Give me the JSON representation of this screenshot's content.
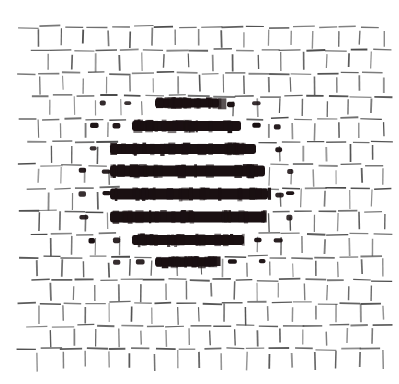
{
  "figure": {
    "title": "Halftone hatch texture with emphasized central lens",
    "type": "abstract-texture",
    "canvas": {
      "width": 399,
      "height": 384,
      "background": "#ffffff"
    },
    "pattern": {
      "name": "staggered-dash-lattice",
      "description": "Regular lattice of short horizontal and vertical dashes arranged in an alternating brick/weave layout",
      "cell_width": 23.0,
      "cell_height": 23.0,
      "origin_x": 27,
      "origin_y": 27,
      "columns": 16,
      "rows": 15,
      "row_stagger_offset": 11.5,
      "dash_horizontal_length": 20,
      "dash_vertical_length": 17,
      "stroke_thin_width": 1.4,
      "stroke_thin_color": "#4b4b4b",
      "stroke_bold_color": "#1a1012",
      "dot_bold_width": 7,
      "dot_bold_height": 4.5
    },
    "emphasis_region": {
      "shape": "lens",
      "center_x": 188,
      "center_y": 183,
      "semi_axis_x": 82,
      "semi_axis_y": 86,
      "fill_color": "#1a1012"
    },
    "bars": [
      {
        "index": 1,
        "x1": 155,
        "x2": 219,
        "y": 103,
        "thickness": 9
      },
      {
        "index": 2,
        "x1": 132,
        "x2": 241,
        "y": 126,
        "thickness": 10
      },
      {
        "index": 3,
        "x1": 110,
        "x2": 256,
        "y": 149,
        "thickness": 10
      },
      {
        "index": 4,
        "x1": 110,
        "x2": 265,
        "y": 171,
        "thickness": 11
      },
      {
        "index": 5,
        "x1": 110,
        "x2": 268,
        "y": 194,
        "thickness": 11
      },
      {
        "index": 6,
        "x1": 110,
        "x2": 266,
        "y": 217,
        "thickness": 11
      },
      {
        "index": 7,
        "x1": 132,
        "x2": 244,
        "y": 240,
        "thickness": 10
      },
      {
        "index": 8,
        "x1": 155,
        "x2": 216,
        "y": 262,
        "thickness": 9
      }
    ],
    "bold_dots": [
      {
        "x": 104,
        "y": 103
      },
      {
        "x": 128,
        "y": 103
      },
      {
        "x": 231,
        "y": 103
      },
      {
        "x": 255,
        "y": 103
      },
      {
        "x": 93,
        "y": 126
      },
      {
        "x": 116,
        "y": 126
      },
      {
        "x": 255,
        "y": 126
      },
      {
        "x": 278,
        "y": 126
      },
      {
        "x": 93,
        "y": 149
      },
      {
        "x": 278,
        "y": 149
      },
      {
        "x": 82,
        "y": 171
      },
      {
        "x": 105,
        "y": 171
      },
      {
        "x": 290,
        "y": 171
      },
      {
        "x": 82,
        "y": 194
      },
      {
        "x": 105,
        "y": 194
      },
      {
        "x": 279,
        "y": 194
      },
      {
        "x": 290,
        "y": 194
      },
      {
        "x": 82,
        "y": 217
      },
      {
        "x": 290,
        "y": 217
      },
      {
        "x": 93,
        "y": 240
      },
      {
        "x": 116,
        "y": 240
      },
      {
        "x": 258,
        "y": 240
      },
      {
        "x": 278,
        "y": 240
      },
      {
        "x": 116,
        "y": 262
      },
      {
        "x": 139,
        "y": 262
      },
      {
        "x": 232,
        "y": 262
      },
      {
        "x": 262,
        "y": 262
      }
    ]
  }
}
